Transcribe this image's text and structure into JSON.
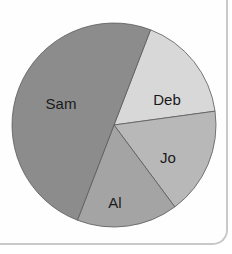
{
  "chart_data": {
    "type": "pie",
    "title": "",
    "categories": [
      "Deb",
      "Jo",
      "Al",
      "Sam"
    ],
    "values": [
      17,
      17,
      16,
      50
    ],
    "unit": "percent (estimated from slice angles)",
    "start_angle_deg": 21,
    "direction": "clockwise",
    "colors": [
      "#d8d8d8",
      "#b8b8b8",
      "#a4a4a4",
      "#8c8c8c"
    ],
    "labels_inside": true,
    "legend": "none",
    "label_positions": [
      {
        "label": "Deb",
        "x": 167,
        "y": 99
      },
      {
        "label": "Jo",
        "x": 168,
        "y": 157
      },
      {
        "label": "Al",
        "x": 115,
        "y": 202
      },
      {
        "label": "Sam",
        "x": 61,
        "y": 103
      }
    ]
  },
  "layout": {
    "center_x": 114,
    "center_y": 125,
    "radius": 102,
    "outline_color": "#5a5a5a",
    "frame_color": "#c9c9c9"
  }
}
